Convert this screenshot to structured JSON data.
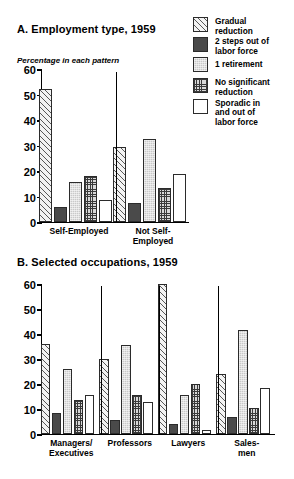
{
  "legend": {
    "items": [
      {
        "label": "Gradual\nreduction",
        "pattern": "hatch",
        "swatch_color": "#f3f3f3"
      },
      {
        "label": "2 steps out of\nlabor force",
        "pattern": "dark",
        "swatch_color": "#4a4a4a"
      },
      {
        "label": "1 retirement",
        "pattern": "stipple",
        "swatch_color": "#c9c9c9"
      },
      {
        "label": "No significant\nreduction",
        "pattern": "grid",
        "swatch_color": "#d8d8d8"
      },
      {
        "label": "Sporadic in\nand out of\nlabor force",
        "pattern": "white",
        "swatch_color": "#ffffff"
      }
    ]
  },
  "panel_a": {
    "title": "A.  Employment type, 1959",
    "axis_note": "Percentage in each pattern"
  },
  "panel_b": {
    "title": "B.  Selected occupations, 1959"
  },
  "chart_data": [
    {
      "type": "bar",
      "id": "panel-a",
      "title": "A.  Employment type, 1959",
      "xlabel": "",
      "ylabel": "Percentage in each pattern",
      "ylim": [
        0,
        60
      ],
      "yticks": [
        0,
        10,
        20,
        30,
        40,
        50,
        60
      ],
      "grid": false,
      "legend_position": "top-right",
      "categories": [
        "Self-Employed",
        "Not Self-Employed"
      ],
      "series": [
        {
          "name": "Gradual reduction",
          "values": [
            52,
            29.5
          ]
        },
        {
          "name": "2 steps out of labor force",
          "values": [
            6,
            7.5
          ]
        },
        {
          "name": "1 retirement",
          "values": [
            15.5,
            32.5
          ]
        },
        {
          "name": "No significant reduction",
          "values": [
            18,
            13.5
          ]
        },
        {
          "name": "Sporadic in and out of labor force",
          "values": [
            8.5,
            19
          ]
        }
      ]
    },
    {
      "type": "bar",
      "id": "panel-b",
      "title": "B.  Selected occupations, 1959",
      "xlabel": "",
      "ylabel": "",
      "ylim": [
        0,
        60
      ],
      "yticks": [
        0,
        10,
        20,
        30,
        40,
        50,
        60
      ],
      "grid": false,
      "legend_position": "shared-top-right",
      "categories": [
        "Managers/\nExecutives",
        "Professors",
        "Lawyers",
        "Sales-\nmen"
      ],
      "series": [
        {
          "name": "Gradual reduction",
          "values": [
            36,
            30,
            60,
            24
          ]
        },
        {
          "name": "2 steps out of labor force",
          "values": [
            8.5,
            5.5,
            4,
            7
          ]
        },
        {
          "name": "1 retirement",
          "values": [
            26,
            35.5,
            15.5,
            41.5
          ]
        },
        {
          "name": "No significant reduction",
          "values": [
            13.5,
            15.5,
            20,
            10.5
          ]
        },
        {
          "name": "Sporadic in and out of labor force",
          "values": [
            15.5,
            13,
            1.5,
            18.5
          ]
        }
      ]
    }
  ]
}
